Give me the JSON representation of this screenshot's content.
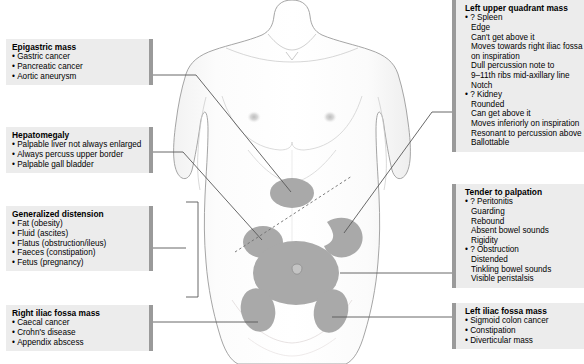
{
  "figure": {
    "colors": {
      "box_background": "#ececec",
      "box_accent_bar": "#9a9a9a",
      "mass_fill": "#a9a9a9",
      "body_fill": "#fbfbfb",
      "body_outline": "#8d8d8d",
      "leader_line": "#555555"
    }
  },
  "callouts": {
    "epigastric_mass": {
      "title": "Epigastric mass",
      "items": [
        {
          "text": "Gastric cancer",
          "bullet": true
        },
        {
          "text": "Pancreatic cancer",
          "bullet": true
        },
        {
          "text": "Aortic aneurysm",
          "bullet": true
        }
      ]
    },
    "hepatomegaly": {
      "title": "Hepatomegaly",
      "items": [
        {
          "text": "Palpable liver not always enlarged",
          "bullet": true
        },
        {
          "text": "Always percuss upper border",
          "bullet": true
        },
        {
          "text": "Palpable gall bladder",
          "bullet": true
        }
      ]
    },
    "generalized_distension": {
      "title": "Generalized distension",
      "items": [
        {
          "text": "Fat (obesity)",
          "bullet": true
        },
        {
          "text": "Fluid (ascites)",
          "bullet": true
        },
        {
          "text": "Flatus (obstruction/ileus)",
          "bullet": true
        },
        {
          "text": "Faeces (constipation)",
          "bullet": true
        },
        {
          "text": "Fetus (pregnancy)",
          "bullet": true
        }
      ]
    },
    "right_iliac_fossa_mass": {
      "title": "Right iliac fossa mass",
      "items": [
        {
          "text": "Caecal cancer",
          "bullet": true
        },
        {
          "text": "Crohn's disease",
          "bullet": true
        },
        {
          "text": "Appendix abscess",
          "bullet": true
        }
      ]
    },
    "left_upper_quadrant_mass": {
      "title": "Left upper quadrant mass",
      "items": [
        {
          "text": "? Spleen",
          "bullet": true
        },
        {
          "text": "Edge",
          "bullet": false
        },
        {
          "text": "Can't get above it",
          "bullet": false
        },
        {
          "text": "Moves towards right iliac fossa",
          "bullet": false
        },
        {
          "text": "on inspiration",
          "bullet": false
        },
        {
          "text": "Dull percussion note to",
          "bullet": false
        },
        {
          "text": "9–11th ribs mid-axillary line",
          "bullet": false
        },
        {
          "text": "Notch",
          "bullet": false
        },
        {
          "text": "? Kidney",
          "bullet": true
        },
        {
          "text": "Rounded",
          "bullet": false
        },
        {
          "text": "Can get above it",
          "bullet": false
        },
        {
          "text": "Moves inferiorly on inspiration",
          "bullet": false
        },
        {
          "text": "Resonant to percussion above it",
          "bullet": false
        },
        {
          "text": "Ballottable",
          "bullet": false
        }
      ]
    },
    "tender_to_palpation": {
      "title": "Tender to palpation",
      "items": [
        {
          "text": "? Peritonitis",
          "bullet": true
        },
        {
          "text": "Guarding",
          "bullet": false
        },
        {
          "text": "Rebound",
          "bullet": false
        },
        {
          "text": "Absent bowel sounds",
          "bullet": false
        },
        {
          "text": "Rigidity",
          "bullet": false
        },
        {
          "text": "? Obstruction",
          "bullet": true
        },
        {
          "text": "Distended",
          "bullet": false
        },
        {
          "text": "Tinkling bowel sounds",
          "bullet": false
        },
        {
          "text": "Visible peristalsis",
          "bullet": false
        }
      ]
    },
    "left_iliac_fossa_mass": {
      "title": "Left iliac fossa mass",
      "items": [
        {
          "text": "Sigmoid colon cancer",
          "bullet": true
        },
        {
          "text": "Constipation",
          "bullet": true
        },
        {
          "text": "Diverticular mass",
          "bullet": true
        }
      ]
    }
  }
}
